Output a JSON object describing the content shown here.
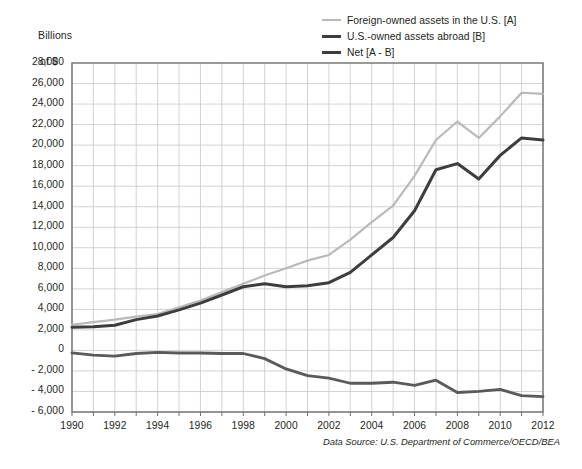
{
  "axis_unit_label": {
    "line1": "Billions",
    "line2": "of $"
  },
  "source_note": "Data Source: U.S. Department of Commerce/OECD/BEA",
  "colors": {
    "foreign_owned": "#b9b9b9",
    "us_owned": "#3d3d3d",
    "net": "#5a5a5a",
    "gridline": "#c8c8c8",
    "axis": "#6f6f6f",
    "text": "#231f20"
  },
  "legend": {
    "position": "top-right",
    "items": [
      {
        "label": "Foreign-owned assets in the U.S. [A]",
        "swatch": "s-foreign"
      },
      {
        "label": "U.S.-owned assets abroad [B]",
        "swatch": "s-usowned"
      },
      {
        "label": "Net [A - B]",
        "swatch": "s-net"
      }
    ]
  },
  "chart_data": {
    "type": "line",
    "title": "",
    "subtitle": "",
    "xlabel": "",
    "ylabel": "Billions of $",
    "xlim": [
      1990,
      2012
    ],
    "ylim": [
      -6000,
      28000
    ],
    "ytick_step": 2000,
    "xtick_step": 2,
    "grid": true,
    "minor_x_grid_step": 1,
    "ytick_labels": [
      "28,000",
      "26,000",
      "24,000",
      "22,000",
      "20,000",
      "18,000",
      "16,000",
      "14,000",
      "12,000",
      "10,000",
      "8,000",
      "6,000",
      "4,000",
      "2,000",
      "0",
      "- 2,000",
      "- 4,000",
      "- 6,000"
    ],
    "ytick_values": [
      28000,
      26000,
      24000,
      22000,
      20000,
      18000,
      16000,
      14000,
      12000,
      10000,
      8000,
      6000,
      4000,
      2000,
      0,
      -2000,
      -4000,
      -6000
    ],
    "xtick_labels": [
      "1990",
      "1992",
      "1994",
      "1996",
      "1998",
      "2000",
      "2002",
      "2004",
      "2006",
      "2008",
      "2010",
      "2012"
    ],
    "xtick_values": [
      1990,
      1992,
      1994,
      1996,
      1998,
      2000,
      2002,
      2004,
      2006,
      2008,
      2010,
      2012
    ],
    "x": [
      1990,
      1991,
      1992,
      1993,
      1994,
      1995,
      1996,
      1997,
      1998,
      1999,
      2000,
      2001,
      2002,
      2003,
      2004,
      2005,
      2006,
      2007,
      2008,
      2009,
      2010,
      2011,
      2012
    ],
    "series": [
      {
        "name": "Foreign-owned assets in the U.S. [A]",
        "color": "#b9b9b9",
        "width": 2.2,
        "values": [
          2500,
          2750,
          3000,
          3300,
          3550,
          4200,
          4850,
          5700,
          6500,
          7300,
          8000,
          8750,
          9300,
          10800,
          12500,
          14100,
          17000,
          20500,
          22300,
          20700,
          22800,
          25100,
          25000
        ]
      },
      {
        "name": "U.S.-owned assets abroad [B]",
        "color": "#3d3d3d",
        "width": 3.0,
        "values": [
          2250,
          2300,
          2450,
          3000,
          3350,
          3950,
          4600,
          5400,
          6200,
          6500,
          6200,
          6300,
          6600,
          7600,
          9300,
          11000,
          13600,
          17600,
          18200,
          16700,
          19000,
          20700,
          20500
        ]
      },
      {
        "name": "Net [A - B]",
        "color": "#5a5a5a",
        "width": 2.8,
        "values": [
          -250,
          -450,
          -550,
          -300,
          -200,
          -250,
          -250,
          -300,
          -300,
          -800,
          -1800,
          -2450,
          -2700,
          -3200,
          -3200,
          -3100,
          -3400,
          -2900,
          -4100,
          -4000,
          -3800,
          -4400,
          -4500
        ]
      }
    ]
  }
}
